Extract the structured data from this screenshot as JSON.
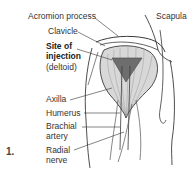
{
  "figure": {
    "number": "1.",
    "labels": {
      "acromion": "Acromion process",
      "scapula": "Scapula",
      "clavicle": "Clavicle",
      "site_line1": "Site of",
      "site_line2": "injection",
      "site_line3": "(deltoid)",
      "axilla": "Axilla",
      "humerus": "Humerus",
      "brachial_line1": "Brachial",
      "brachial_line2": "artery",
      "radial_line1": "Radial",
      "radial_line2": "nerve"
    },
    "colors": {
      "line": "#3a3a3a",
      "muscle_fill": "#d8d8d8",
      "injection_site": "#6e6e6e"
    }
  }
}
